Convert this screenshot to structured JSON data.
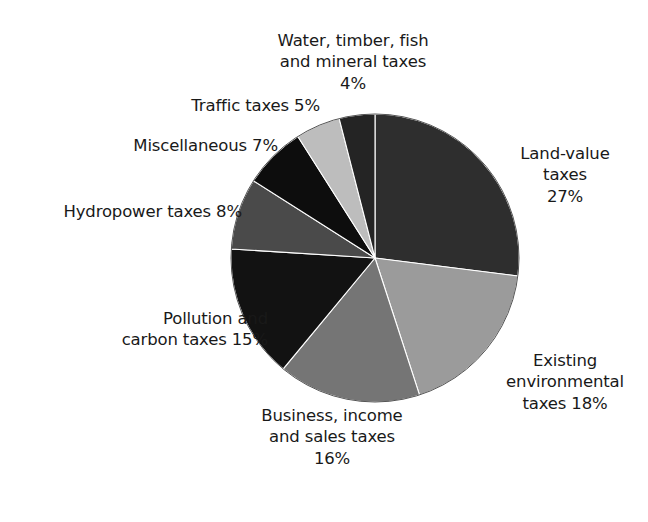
{
  "figure": {
    "name": "tax-shift-pie-chart",
    "background_color": "#ffffff",
    "text_color": "#191919"
  },
  "chart_data": {
    "type": "pie",
    "title": "",
    "subtitle": "",
    "xlabel": "",
    "ylabel": "",
    "grid": false,
    "legend_position": "none",
    "label_format": "{name} {value}%",
    "start_angle_deg": 0,
    "direction": "clockwise",
    "total": 100,
    "units": "percent",
    "categories": [
      "Land-value taxes",
      "Existing environmental taxes",
      "Business, income and sales taxes",
      "Pollution and carbon taxes",
      "Hydropower taxes",
      "Miscellaneous",
      "Traffic taxes",
      "Water, timber, fish and mineral taxes"
    ],
    "values": [
      27,
      18,
      16,
      15,
      8,
      7,
      5,
      4
    ],
    "colors": [
      "#2e2e2e",
      "#9b9b9b",
      "#757575",
      "#121212",
      "#4a4a4a",
      "#0d0d0d",
      "#bdbdbd",
      "#242424"
    ],
    "slices": [
      {
        "name": "Land-value taxes",
        "value": 27,
        "color": "#2e2e2e",
        "label_lines": [
          "Land-value",
          "taxes",
          "27%"
        ]
      },
      {
        "name": "Existing environmental taxes",
        "value": 18,
        "color": "#9b9b9b",
        "label_lines": [
          "Existing",
          "environmental",
          "taxes 18%"
        ]
      },
      {
        "name": "Business, income and sales taxes",
        "value": 16,
        "color": "#757575",
        "label_lines": [
          "Business, income",
          "and sales taxes",
          "16%"
        ]
      },
      {
        "name": "Pollution and carbon taxes",
        "value": 15,
        "color": "#121212",
        "label_lines": [
          "Pollution and",
          "carbon taxes 15%"
        ]
      },
      {
        "name": "Hydropower taxes",
        "value": 8,
        "color": "#4a4a4a",
        "label_lines": [
          "Hydropower taxes 8%"
        ]
      },
      {
        "name": "Miscellaneous",
        "value": 7,
        "color": "#0d0d0d",
        "label_lines": [
          "Miscellaneous 7%"
        ]
      },
      {
        "name": "Traffic taxes",
        "value": 5,
        "color": "#bdbdbd",
        "label_lines": [
          "Traffic taxes 5%"
        ]
      },
      {
        "name": "Water, timber, fish and mineral taxes",
        "value": 4,
        "color": "#242424",
        "label_lines": [
          "Water, timber, fish",
          "and mineral taxes",
          "4%"
        ]
      }
    ]
  },
  "labels": {
    "water_timber_fish": "Water, timber, fish\nand mineral taxes\n4%",
    "traffic": "Traffic taxes 5%",
    "miscellaneous": "Miscellaneous 7%",
    "hydropower": "Hydropower taxes 8%",
    "pollution": "Pollution and\ncarbon taxes 15%",
    "business": "Business, income\nand sales taxes\n16%",
    "land_value": "Land-value\ntaxes\n27%",
    "existing_environmental": "Existing\nenvironmental\ntaxes 18%"
  }
}
